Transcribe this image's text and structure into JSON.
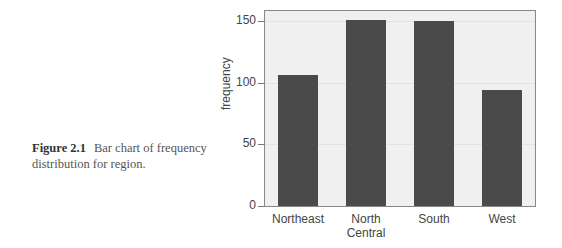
{
  "caption": {
    "figure_label": "Figure 2.1",
    "text": "Bar chart of frequency distribution for region."
  },
  "chart_data": {
    "type": "bar",
    "title": "",
    "xlabel": "",
    "ylabel": "frequency",
    "categories": [
      "Northeast",
      "North Central",
      "South",
      "West"
    ],
    "category_lines": [
      [
        "Northeast"
      ],
      [
        "North",
        "Central"
      ],
      [
        "South"
      ],
      [
        "West"
      ]
    ],
    "values": [
      106,
      151,
      150,
      94
    ],
    "ylim": [
      0,
      158
    ],
    "yticks": [
      0,
      50,
      100,
      150
    ],
    "grid": true,
    "legend": null,
    "bar_color": "#4a4a4a",
    "background_color": "#f0f0f0"
  }
}
